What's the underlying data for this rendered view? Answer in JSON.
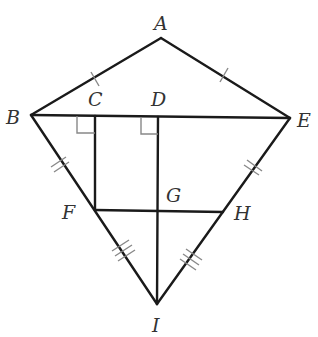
{
  "figure": {
    "type": "geometry-kite-diagram",
    "labels": {
      "A": "A",
      "B": "B",
      "C": "C",
      "D": "D",
      "E": "E",
      "F": "F",
      "G": "G",
      "H": "H",
      "I": "I"
    },
    "points": {
      "A": [
        161,
        38
      ],
      "B": [
        31,
        115
      ],
      "C": [
        95,
        116
      ],
      "D": [
        158,
        117
      ],
      "E": [
        290,
        118
      ],
      "F": [
        95,
        210
      ],
      "G": [
        158,
        211
      ],
      "H": [
        223,
        212
      ],
      "I": [
        157,
        304
      ]
    },
    "segments": [
      [
        "A",
        "B"
      ],
      [
        "A",
        "E"
      ],
      [
        "B",
        "E"
      ],
      [
        "B",
        "I"
      ],
      [
        "E",
        "I"
      ],
      [
        "C",
        "F"
      ],
      [
        "D",
        "I"
      ],
      [
        "F",
        "H"
      ]
    ],
    "congruence_marks": [
      {
        "segment": "AB",
        "ticks": 1
      },
      {
        "segment": "AE",
        "ticks": 1
      },
      {
        "segment": "BF",
        "ticks": 2
      },
      {
        "segment": "EH",
        "ticks": 2
      },
      {
        "segment": "FI",
        "ticks": 3
      },
      {
        "segment": "HI",
        "ticks": 3
      }
    ],
    "right_angles": [
      "C",
      "D"
    ],
    "colors": {
      "line": "#1a1a1a",
      "mark": "#888888",
      "label": "#333333"
    }
  }
}
